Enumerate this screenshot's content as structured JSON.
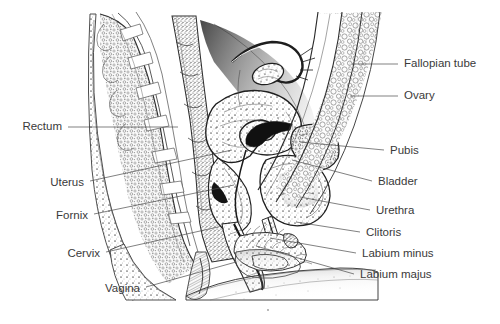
{
  "figure": {
    "style": "pen-and-ink engraving",
    "background_color": "#ffffff",
    "ink_color": "#2b2b2b",
    "label_color": "#3a3a3a",
    "leader_color": "#4a4a4a"
  },
  "labels_left": [
    {
      "id": "rectum",
      "text": "Rectum",
      "x": 62,
      "y": 127,
      "tip_x": 178,
      "tip_y": 127
    },
    {
      "id": "uterus",
      "text": "Uterus",
      "x": 84,
      "y": 183,
      "tip_x": 232,
      "tip_y": 150
    },
    {
      "id": "fornix",
      "text": "Fornix",
      "x": 88,
      "y": 216,
      "tip_x": 234,
      "tip_y": 185
    },
    {
      "id": "cervix",
      "text": "Cervix",
      "x": 100,
      "y": 254,
      "tip_x": 218,
      "tip_y": 227
    },
    {
      "id": "vagina",
      "text": "Vagina",
      "x": 140,
      "y": 289,
      "tip_x": 236,
      "tip_y": 262
    }
  ],
  "labels_right": [
    {
      "id": "fallopian-tube",
      "text": "Fallopian tube",
      "x": 404,
      "y": 64,
      "tip_x": 352,
      "tip_y": 64
    },
    {
      "id": "ovary",
      "text": "Ovary",
      "x": 404,
      "y": 96,
      "tip_x": 350,
      "tip_y": 96
    },
    {
      "id": "pubis",
      "text": "Pubis",
      "x": 390,
      "y": 151,
      "tip_x": 300,
      "tip_y": 142
    },
    {
      "id": "bladder",
      "text": "Bladder",
      "x": 378,
      "y": 182,
      "tip_x": 292,
      "tip_y": 160
    },
    {
      "id": "urethra",
      "text": "Urethra",
      "x": 376,
      "y": 211,
      "tip_x": 300,
      "tip_y": 197
    },
    {
      "id": "clitoris",
      "text": "Clitoris",
      "x": 366,
      "y": 233,
      "tip_x": 296,
      "tip_y": 222
    },
    {
      "id": "labium-minus",
      "text": "Labium minus",
      "x": 362,
      "y": 254,
      "tip_x": 270,
      "tip_y": 238
    },
    {
      "id": "labium-majus",
      "text": "Labium majus",
      "x": 360,
      "y": 275,
      "tip_x": 256,
      "tip_y": 246
    }
  ]
}
